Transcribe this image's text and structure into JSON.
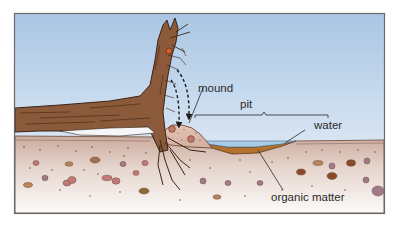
{
  "figure": {
    "labels": {
      "mound": "mound",
      "pit": "pit",
      "water": "water",
      "organic_matter": "organic matter"
    },
    "colors": {
      "sky_top": "#a9c6e4",
      "sky_bottom": "#f2f6fb",
      "soil_top": "#c9a99a",
      "soil_bottom": "#fbf8f6",
      "trunk": "#8a5a3b",
      "trunk_outline": "#3b2416",
      "water": "#a8cbe6",
      "organic_matter": "#b3722f",
      "frame": "#6a6a6a",
      "pebble": "#b98070"
    }
  }
}
